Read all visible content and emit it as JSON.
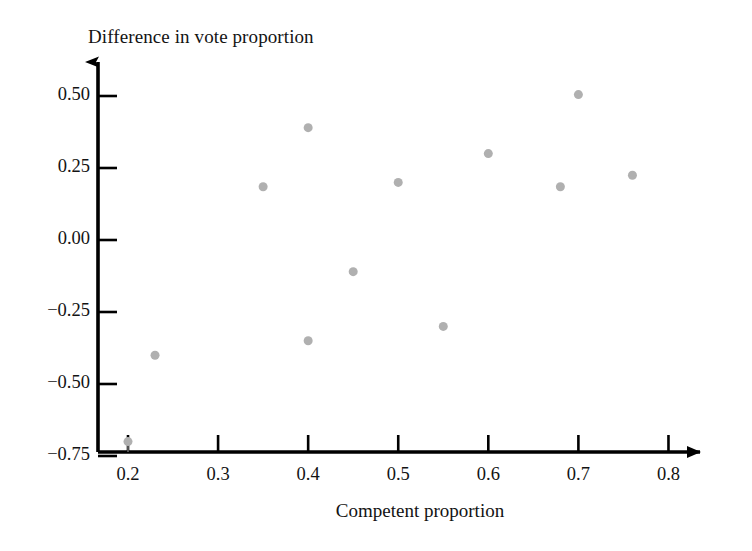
{
  "chart_data": {
    "type": "scatter",
    "title": "Difference in vote proportion",
    "xlabel": "Competent proportion",
    "ylabel": "Difference in vote proportion",
    "xlim": [
      0.155,
      0.835
    ],
    "ylim": [
      -0.79,
      0.585
    ],
    "grid": false,
    "legend": null,
    "marker_color": "#b0b0b0",
    "marker_size_px": 9,
    "axis_color": "#000000",
    "background": "#ffffff",
    "xticks": [
      0.2,
      0.3,
      0.4,
      0.5,
      0.6,
      0.7,
      0.8
    ],
    "xtick_labels": [
      "0.2",
      "0.3",
      "0.4",
      "0.5",
      "0.6",
      "0.7",
      "0.8"
    ],
    "yticks": [
      0.5,
      0.25,
      0,
      -0.25,
      -0.5,
      -0.75
    ],
    "ytick_labels": [
      "0.50",
      "0.25",
      "0.00",
      "−0.25",
      "−0.50",
      "−0.75"
    ],
    "points": [
      {
        "x": 0.2,
        "y": -0.7,
        "stem": true
      },
      {
        "x": 0.23,
        "y": -0.4,
        "stem": false
      },
      {
        "x": 0.35,
        "y": 0.185,
        "stem": false
      },
      {
        "x": 0.4,
        "y": 0.39,
        "stem": false
      },
      {
        "x": 0.4,
        "y": -0.35,
        "stem": false
      },
      {
        "x": 0.45,
        "y": -0.11,
        "stem": false
      },
      {
        "x": 0.5,
        "y": 0.2,
        "stem": false
      },
      {
        "x": 0.55,
        "y": -0.3,
        "stem": false
      },
      {
        "x": 0.6,
        "y": 0.3,
        "stem": false
      },
      {
        "x": 0.68,
        "y": 0.185,
        "stem": false
      },
      {
        "x": 0.7,
        "y": 0.505,
        "stem": false
      },
      {
        "x": 0.76,
        "y": 0.225,
        "stem": false
      }
    ]
  }
}
